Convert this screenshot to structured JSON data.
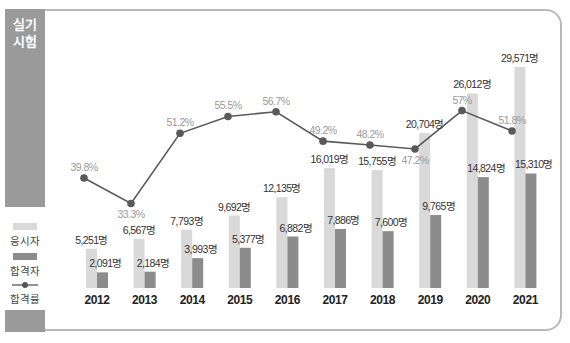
{
  "header": {
    "title_line1": "실기",
    "title_line2": "시험"
  },
  "legend": [
    {
      "label": "응시자",
      "color": "#d9d9d9",
      "type": "bar"
    },
    {
      "label": "합격자",
      "color": "#8c8c8c",
      "type": "bar"
    },
    {
      "label": "합격률",
      "color": "#555555",
      "type": "line"
    }
  ],
  "colors": {
    "applicants": "#d9d9d9",
    "passers": "#8c8c8c",
    "line": "#5a5a5a",
    "panel": "#9a9a9a"
  },
  "chart_data": {
    "type": "bar",
    "title": "실기 시험",
    "categories": [
      "2012",
      "2013",
      "2014",
      "2015",
      "2016",
      "2017",
      "2018",
      "2019",
      "2020",
      "2021"
    ],
    "series": [
      {
        "name": "응시자",
        "type": "bar",
        "values": [
          5251,
          6567,
          7793,
          9692,
          12135,
          16019,
          15755,
          20704,
          26012,
          29571
        ],
        "labels": [
          "5,251명",
          "6,567명",
          "7,793명",
          "9,692명",
          "12,135명",
          "16,019명",
          "15,755명",
          "20,704명",
          "26,012명",
          "29,571명"
        ]
      },
      {
        "name": "합격자",
        "type": "bar",
        "values": [
          2091,
          2184,
          3993,
          5377,
          6882,
          7886,
          7600,
          9765,
          14824,
          15310
        ],
        "labels": [
          "2,091명",
          "2,184명",
          "3,993명",
          "5,377명",
          "6,882명",
          "7,886명",
          "7,600명",
          "9,765명",
          "14,824명",
          "15,310명"
        ]
      },
      {
        "name": "합격률",
        "type": "line",
        "unit": "%",
        "values": [
          39.8,
          33.3,
          51.2,
          55.5,
          56.7,
          49.2,
          48.2,
          47.2,
          57.0,
          51.8
        ],
        "labels": [
          "39.8%",
          "33.3%",
          "51.2%",
          "55.5%",
          "56.7%",
          "49.2%",
          "48.2%",
          "47.2%",
          "57%",
          "51.8%"
        ]
      }
    ],
    "xlabel": "",
    "ylabel": "",
    "grid": false,
    "legend_position": "left"
  }
}
